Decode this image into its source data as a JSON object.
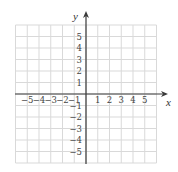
{
  "chart_data": {
    "type": "scatter",
    "title": "",
    "xlabel": "x",
    "ylabel": "y",
    "xlim": [
      -6,
      6
    ],
    "ylim": [
      -6,
      6
    ],
    "grid": true,
    "x_ticks": [
      -5,
      -4,
      -3,
      -2,
      -1,
      1,
      2,
      3,
      4,
      5
    ],
    "y_ticks": [
      5,
      4,
      3,
      2,
      1,
      -1,
      -2,
      -3,
      -4,
      -5
    ],
    "x_tick_labels": [
      "−5",
      "−4",
      "−3",
      "−2",
      "−1",
      "1",
      "2",
      "3",
      "4",
      "5"
    ],
    "y_tick_labels": [
      "5",
      "4",
      "3",
      "2",
      "1",
      "−1",
      "−2",
      "−3",
      "−4",
      "−5"
    ],
    "series": [],
    "colors": {
      "grid": "#d9d9d9",
      "axis": "#3a3a3a",
      "text": "#444444"
    }
  }
}
